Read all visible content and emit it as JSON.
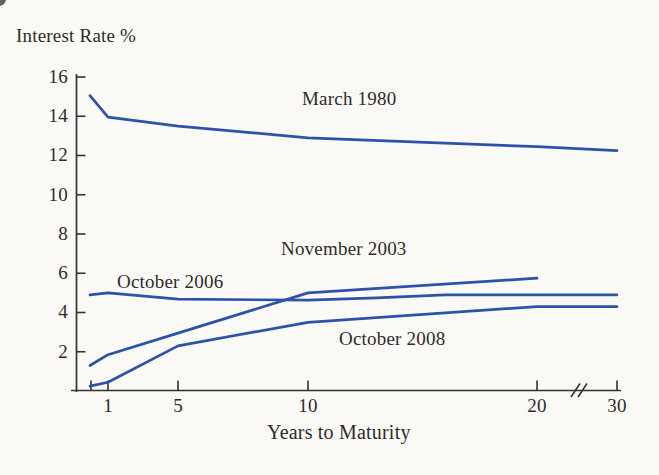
{
  "chart_data": {
    "type": "line",
    "title": "Interest Rate %",
    "xlabel": "Years to Maturity",
    "ylabel": "Interest Rate %",
    "ylim": [
      0,
      16
    ],
    "grid": false,
    "legend_position": "inline-labels-on-curves",
    "x_ticks": [
      "1",
      "5",
      "10",
      "20",
      "30"
    ],
    "y_ticks": [
      "16",
      "14",
      "12",
      "10",
      "8",
      "6",
      "4",
      "2"
    ],
    "y_tick_values": [
      16,
      14,
      12,
      10,
      8,
      6,
      4,
      2
    ],
    "axis_break": {
      "between": [
        20,
        30
      ],
      "style": "double-slash"
    },
    "x_unit": "years",
    "y_unit": "percent",
    "line_color": "#2d53a9",
    "axis_color": "#35332f",
    "series": [
      {
        "name": "March 1980",
        "shape": "inverted",
        "points": [
          [
            0.25,
            15.05
          ],
          [
            1,
            13.95
          ],
          [
            5,
            13.5
          ],
          [
            10,
            12.9
          ],
          [
            20,
            12.45
          ],
          [
            30,
            12.25
          ]
        ]
      },
      {
        "name": "November 2003",
        "shape": "steeply rising, ends at 20 years",
        "points": [
          [
            0.25,
            1.3
          ],
          [
            1,
            1.85
          ],
          [
            5,
            2.95
          ],
          [
            10,
            5.0
          ],
          [
            20,
            5.75
          ]
        ]
      },
      {
        "name": "October 2006",
        "shape": "flat / slightly humped",
        "points": [
          [
            0.25,
            4.9
          ],
          [
            1,
            5.0
          ],
          [
            5,
            4.68
          ],
          [
            10,
            4.63
          ],
          [
            13,
            4.75
          ],
          [
            16,
            4.9
          ],
          [
            30,
            4.9
          ]
        ]
      },
      {
        "name": "October 2008",
        "shape": "steeply rising from near zero",
        "points": [
          [
            0.25,
            0.25
          ],
          [
            1,
            0.45
          ],
          [
            5,
            2.3
          ],
          [
            10,
            3.5
          ],
          [
            20,
            4.3
          ],
          [
            30,
            4.3
          ]
        ]
      }
    ],
    "layout": {
      "x_anchors": [
        [
          0.25,
          90
        ],
        [
          1,
          108
        ],
        [
          5,
          178
        ],
        [
          10,
          308
        ],
        [
          20,
          537
        ],
        [
          30,
          617
        ]
      ],
      "x_tick_px": [
        91,
        108,
        178,
        308,
        537,
        617
      ],
      "x_tick_labeled_px": [
        108,
        178,
        308,
        537,
        617
      ],
      "y_base_px": 391,
      "px_per_unit": 19.625,
      "axis_x_px": 76.5,
      "axis_top_px": 74,
      "haxis_left_px": 71,
      "haxis_right_px": 621,
      "break_px": 579,
      "stroke_width": 2.7
    }
  }
}
